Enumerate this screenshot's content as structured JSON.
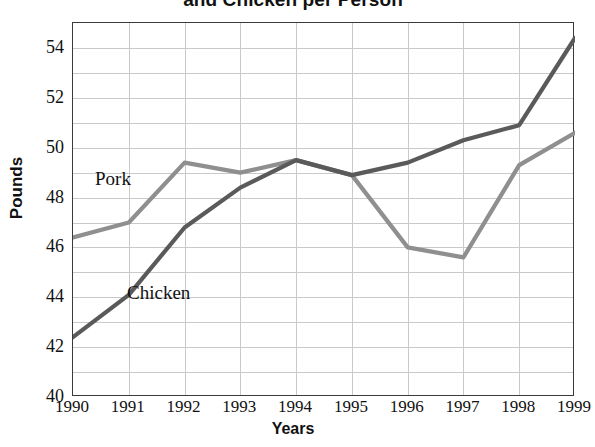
{
  "chart_data": {
    "type": "line",
    "title": "and Chicken per Person",
    "xlabel": "Years",
    "ylabel": "Pounds",
    "x": [
      "1990",
      "1991",
      "1992",
      "1993",
      "1994",
      "1995",
      "1996",
      "1997",
      "1998",
      "1999"
    ],
    "categories": [
      "1990",
      "1991",
      "1992",
      "1993",
      "1994",
      "1995",
      "1996",
      "1997",
      "1998",
      "1999"
    ],
    "xlim": [
      1990,
      1999
    ],
    "ylim": [
      40,
      55
    ],
    "ytick_labels": [
      "40",
      "42",
      "44",
      "46",
      "48",
      "50",
      "52",
      "54"
    ],
    "ytick_values": [
      40,
      42,
      44,
      46,
      48,
      50,
      52,
      54
    ],
    "grid": true,
    "grid_step": 1,
    "legend_position": "inline-annotations",
    "series": [
      {
        "name": "Pork",
        "color": "#8f8f8f",
        "values": [
          46.4,
          47.0,
          49.4,
          49.0,
          49.5,
          48.9,
          46.0,
          45.6,
          49.3,
          50.6
        ]
      },
      {
        "name": "Chicken",
        "color": "#5a5a5a",
        "values": [
          42.4,
          44.1,
          46.8,
          48.4,
          49.5,
          48.9,
          49.4,
          50.3,
          50.9,
          54.4
        ]
      }
    ],
    "annotations": [
      {
        "text": "Pork",
        "series": "Pork"
      },
      {
        "text": "Chicken",
        "series": "Chicken"
      }
    ]
  },
  "colors": {
    "pork_line": "#8f8f8f",
    "chicken_line": "#5a5a5a",
    "grid": "#c9c9c9",
    "frame": "#3a3a3a",
    "text": "#111111",
    "background": "#ffffff"
  }
}
